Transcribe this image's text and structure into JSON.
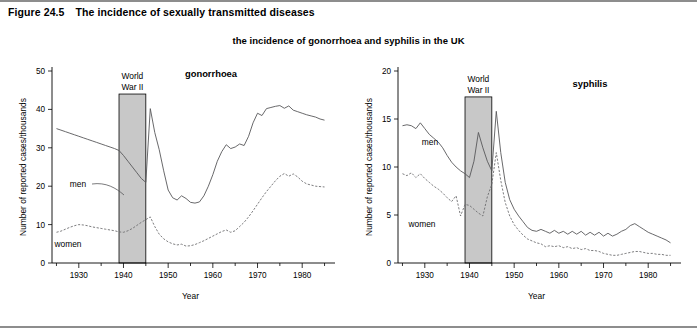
{
  "figure": {
    "number": "Figure 24.5",
    "caption": "The incidence of sexually transmitted diseases",
    "subtitle": "the incidence of gonorrhoea and syphilis in the UK"
  },
  "colors": {
    "men_line": "#58585a",
    "women_line": "#6e6e70",
    "war_band": "#c8c8c8",
    "rule": "#8d8d8d",
    "text": "#000000"
  },
  "chart_data": [
    {
      "type": "line",
      "title": "gonorrhoea",
      "xlabel": "Year",
      "ylabel": "Number of reported cases/thousands",
      "xlim": [
        1924,
        1986
      ],
      "ylim": [
        0,
        50
      ],
      "yticks": [
        0,
        10,
        20,
        30,
        40,
        50
      ],
      "ytick_labels": [
        "0",
        "10",
        "20",
        "30",
        "40",
        "50"
      ],
      "xticks": [
        1930,
        1940,
        1950,
        1960,
        1970,
        1980
      ],
      "xtick_labels": [
        "1930",
        "1940",
        "1950",
        "1960",
        "1970",
        "1980"
      ],
      "minor_xticks": [
        1925,
        1935,
        1945,
        1955,
        1965,
        1975,
        1985
      ],
      "grid": false,
      "legend_position": "inline-labels",
      "annotations": [
        {
          "name": "war-band",
          "label": "World War II",
          "x_start": 1939,
          "x_end": 1945,
          "y_top": 44
        }
      ],
      "series": [
        {
          "name": "men",
          "style": "solid",
          "x": [
            1925,
            1926,
            1927,
            1928,
            1929,
            1930,
            1931,
            1932,
            1933,
            1934,
            1935,
            1936,
            1937,
            1938,
            1939,
            1940,
            1941,
            1942,
            1943,
            1944,
            1945,
            1946,
            1947,
            1948,
            1949,
            1950,
            1951,
            1952,
            1953,
            1954,
            1955,
            1956,
            1957,
            1958,
            1959,
            1960,
            1961,
            1962,
            1963,
            1964,
            1965,
            1966,
            1967,
            1968,
            1969,
            1970,
            1971,
            1972,
            1973,
            1974,
            1975,
            1976,
            1977,
            1978,
            1979,
            1980,
            1981,
            1982,
            1983,
            1984,
            1985
          ],
          "values": [
            35.0,
            34.6,
            34.2,
            33.8,
            33.4,
            33.0,
            32.6,
            32.2,
            31.8,
            31.4,
            31.0,
            30.6,
            30.2,
            29.8,
            29.3,
            28.0,
            26.5,
            25.0,
            23.5,
            22.0,
            21.0,
            40.2,
            34.0,
            29.5,
            24.0,
            19.0,
            17.0,
            16.4,
            17.5,
            16.8,
            15.8,
            15.6,
            15.9,
            17.5,
            20.0,
            23.0,
            26.5,
            29.0,
            30.8,
            29.8,
            30.2,
            31.0,
            30.6,
            33.0,
            36.5,
            39.0,
            38.4,
            40.2,
            40.5,
            40.8,
            41.0,
            40.3,
            40.9,
            39.8,
            39.4,
            39.0,
            38.6,
            38.3,
            38.0,
            37.5,
            37.2
          ]
        },
        {
          "name": "women",
          "style": "dashed",
          "x": [
            1925,
            1926,
            1927,
            1928,
            1929,
            1930,
            1931,
            1932,
            1933,
            1934,
            1935,
            1936,
            1937,
            1938,
            1939,
            1940,
            1941,
            1942,
            1943,
            1944,
            1945,
            1946,
            1947,
            1948,
            1949,
            1950,
            1951,
            1952,
            1953,
            1954,
            1955,
            1956,
            1957,
            1958,
            1959,
            1960,
            1961,
            1962,
            1963,
            1964,
            1965,
            1966,
            1967,
            1968,
            1969,
            1970,
            1971,
            1972,
            1973,
            1974,
            1975,
            1976,
            1977,
            1978,
            1979,
            1980,
            1981,
            1982,
            1983,
            1984,
            1985
          ],
          "values": [
            8.0,
            8.3,
            8.8,
            9.3,
            9.7,
            10.0,
            9.9,
            9.7,
            9.4,
            9.2,
            9.0,
            8.8,
            8.6,
            8.4,
            8.1,
            8.0,
            8.4,
            9.0,
            9.8,
            10.6,
            11.3,
            12.0,
            9.5,
            7.5,
            6.3,
            5.5,
            5.0,
            4.7,
            4.9,
            4.4,
            4.5,
            4.8,
            5.3,
            5.8,
            6.4,
            7.0,
            7.6,
            8.2,
            8.6,
            8.0,
            8.4,
            9.5,
            10.6,
            12.0,
            13.6,
            15.3,
            17.0,
            18.6,
            20.0,
            21.4,
            22.6,
            23.3,
            22.6,
            23.2,
            22.4,
            21.3,
            20.6,
            20.3,
            20.0,
            19.9,
            19.8
          ]
        }
      ]
    },
    {
      "type": "line",
      "title": "syphilis",
      "xlabel": "Year",
      "ylabel": "Number of reported cases/thousands",
      "xlim": [
        1924,
        1986
      ],
      "ylim": [
        0,
        20
      ],
      "yticks": [
        0,
        5,
        10,
        15,
        20
      ],
      "ytick_labels": [
        "0",
        "5",
        "10",
        "15",
        "20"
      ],
      "xticks": [
        1930,
        1940,
        1950,
        1960,
        1970,
        1980
      ],
      "xtick_labels": [
        "1930",
        "1940",
        "1950",
        "1960",
        "1970",
        "1980"
      ],
      "minor_xticks": [
        1925,
        1935,
        1945,
        1955,
        1965,
        1975,
        1985
      ],
      "grid": false,
      "legend_position": "inline-labels",
      "annotations": [
        {
          "name": "war-band",
          "label": "World War II",
          "x_start": 1939,
          "x_end": 1945,
          "y_top": 17.3
        }
      ],
      "series": [
        {
          "name": "men",
          "style": "solid",
          "x": [
            1925,
            1926,
            1927,
            1928,
            1929,
            1930,
            1931,
            1932,
            1933,
            1934,
            1935,
            1936,
            1937,
            1938,
            1939,
            1940,
            1941,
            1942,
            1943,
            1944,
            1945,
            1946,
            1947,
            1948,
            1949,
            1950,
            1951,
            1952,
            1953,
            1954,
            1955,
            1956,
            1957,
            1958,
            1959,
            1960,
            1961,
            1962,
            1963,
            1964,
            1965,
            1966,
            1967,
            1968,
            1969,
            1970,
            1971,
            1972,
            1973,
            1974,
            1975,
            1976,
            1977,
            1978,
            1979,
            1980,
            1981,
            1982,
            1983,
            1984,
            1985
          ],
          "values": [
            14.3,
            14.4,
            14.3,
            14.0,
            14.6,
            14.0,
            13.4,
            13.0,
            12.6,
            12.0,
            11.2,
            10.5,
            10.0,
            9.6,
            9.3,
            8.9,
            10.6,
            13.6,
            12.0,
            10.6,
            9.6,
            15.8,
            11.5,
            8.4,
            6.6,
            5.6,
            4.9,
            4.3,
            3.7,
            3.4,
            3.3,
            3.5,
            3.3,
            3.1,
            3.4,
            3.1,
            3.3,
            3.0,
            3.3,
            3.0,
            3.3,
            2.9,
            3.2,
            2.9,
            3.2,
            2.8,
            3.1,
            2.8,
            3.0,
            3.3,
            3.5,
            3.9,
            4.1,
            3.8,
            3.5,
            3.2,
            3.0,
            2.8,
            2.6,
            2.4,
            2.1
          ]
        },
        {
          "name": "women",
          "style": "dashed",
          "x": [
            1925,
            1926,
            1927,
            1928,
            1929,
            1930,
            1931,
            1932,
            1933,
            1934,
            1935,
            1936,
            1937,
            1938,
            1939,
            1940,
            1941,
            1942,
            1943,
            1944,
            1945,
            1946,
            1947,
            1948,
            1949,
            1950,
            1951,
            1952,
            1953,
            1954,
            1955,
            1956,
            1957,
            1958,
            1959,
            1960,
            1961,
            1962,
            1963,
            1964,
            1965,
            1966,
            1967,
            1968,
            1969,
            1970,
            1971,
            1972,
            1973,
            1974,
            1975,
            1976,
            1977,
            1978,
            1979,
            1980,
            1981,
            1982,
            1983,
            1984,
            1985
          ],
          "values": [
            9.3,
            9.1,
            9.4,
            8.9,
            9.3,
            8.8,
            8.4,
            8.0,
            7.7,
            7.3,
            6.8,
            6.4,
            7.0,
            4.9,
            6.1,
            6.0,
            5.6,
            5.2,
            4.9,
            6.9,
            8.2,
            11.5,
            8.6,
            6.3,
            4.9,
            4.0,
            3.4,
            2.9,
            2.5,
            2.3,
            2.1,
            2.0,
            1.7,
            1.8,
            1.7,
            1.8,
            1.6,
            1.7,
            1.5,
            1.6,
            1.4,
            1.5,
            1.3,
            1.3,
            1.2,
            1.0,
            0.9,
            0.8,
            0.8,
            0.9,
            1.0,
            1.1,
            1.2,
            1.2,
            1.1,
            1.0,
            1.0,
            0.9,
            0.9,
            0.8,
            0.8
          ]
        }
      ]
    }
  ]
}
